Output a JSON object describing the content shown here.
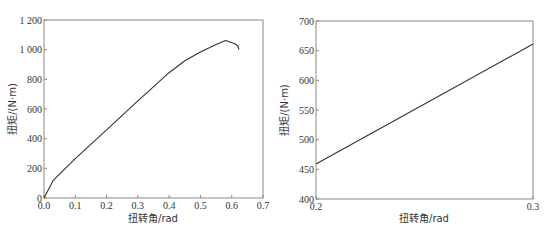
{
  "chart_data": [
    {
      "type": "line",
      "title": "",
      "xlabel": "扭转角/rad",
      "ylabel": "扭矩/(N·m)",
      "xlim": [
        0.0,
        0.7
      ],
      "ylim": [
        0,
        1200
      ],
      "xticks": [
        0.0,
        0.1,
        0.2,
        0.3,
        0.4,
        0.5,
        0.6,
        0.7
      ],
      "xtick_labels": [
        "0.0",
        "0.1",
        "0.2",
        "0.3",
        "0.4",
        "0.5",
        "0.6",
        "0.7"
      ],
      "yticks": [
        0,
        200,
        400,
        600,
        800,
        1000,
        1200
      ],
      "ytick_labels": [
        "0",
        "200",
        "400",
        "600",
        "800",
        "1 000",
        "1 200"
      ],
      "grid": false,
      "legend": null,
      "series": [
        {
          "name": "torque-twist",
          "x": [
            0.0,
            0.03,
            0.1,
            0.2,
            0.3,
            0.4,
            0.45,
            0.5,
            0.55,
            0.58,
            0.61,
            0.62,
            0.623
          ],
          "y": [
            0,
            121,
            265,
            460,
            655,
            845,
            925,
            985,
            1035,
            1062,
            1040,
            1025,
            1000
          ]
        }
      ]
    },
    {
      "type": "line",
      "title": "",
      "xlabel": "扭转角/rad",
      "ylabel": "扭矩/(N·m)",
      "xlim": [
        0.2,
        0.3
      ],
      "ylim": [
        400,
        700
      ],
      "xticks": [
        0.2,
        0.3
      ],
      "xtick_labels": [
        "0.2",
        "0.3"
      ],
      "yticks": [
        400,
        450,
        500,
        550,
        600,
        650,
        700
      ],
      "ytick_labels": [
        "400",
        "450",
        "500",
        "550",
        "600",
        "650",
        "700"
      ],
      "grid": false,
      "legend": null,
      "series": [
        {
          "name": "torque-twist-zoom",
          "x": [
            0.2,
            0.3
          ],
          "y": [
            459,
            661
          ]
        }
      ]
    }
  ]
}
